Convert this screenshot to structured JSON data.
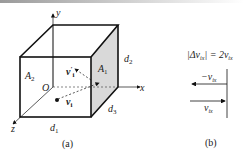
{
  "figure_a": {
    "caption": "(a)",
    "axes": {
      "x": "x",
      "y": "y",
      "z": "z",
      "origin": "O"
    },
    "faces": {
      "left": "A2",
      "right": "A1"
    },
    "dimensions": {
      "d1": "d1",
      "d2": "d2",
      "d3": "d3"
    },
    "vectors": {
      "incoming": "v_i",
      "outgoing": "v'_i"
    },
    "shaded_face_color": "#d9d9d9"
  },
  "figure_b": {
    "caption": "(b)",
    "equation": "|Δv_ix| = 2v_ix",
    "arrow_top_label": "−v_ix",
    "arrow_bottom_label": "v_ix"
  }
}
